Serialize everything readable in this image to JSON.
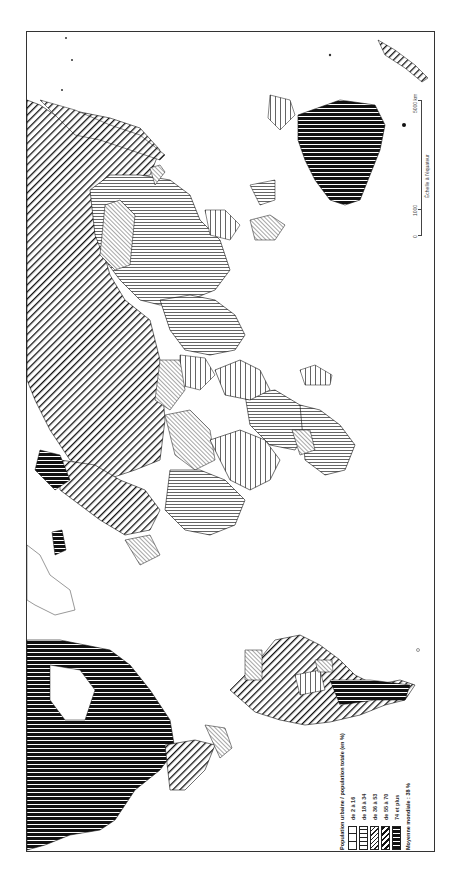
{
  "map": {
    "orientation": "rotated 90° clockwise (north at left)",
    "subject": "World map of urbanization rate by country",
    "colors": {
      "ink": "#111111",
      "paper": "#ffffff",
      "frame": "#333333"
    }
  },
  "legend": {
    "title": "Population urbaine / population totale (en %)",
    "classes": [
      {
        "label": "de 2 à 16",
        "pattern": "wide-vertical-lines"
      },
      {
        "label": "de 18 à 34",
        "pattern": "fine-vertical-lines"
      },
      {
        "label": "de 36 à 53",
        "pattern": "fine-diagonal-lines"
      },
      {
        "label": "de 55 à 70",
        "pattern": "bold-diagonal-lines"
      },
      {
        "label": "74 et plus",
        "pattern": "dense-black-lines"
      }
    ],
    "note": "Moyenne mondiale : 38 %"
  },
  "scale": {
    "zero": "0",
    "mid": "1000",
    "end": "5000 km",
    "caption": "Échelle à l'équateur"
  }
}
